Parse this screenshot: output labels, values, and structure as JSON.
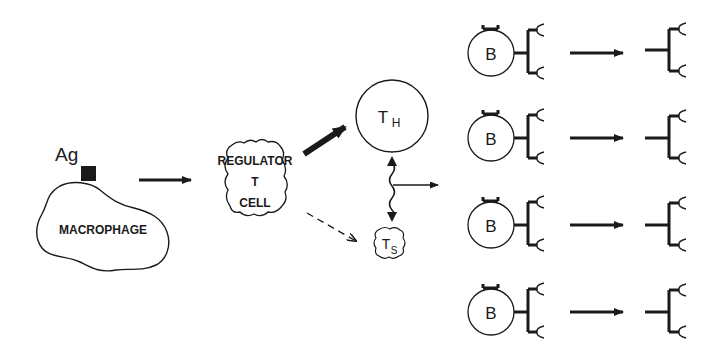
{
  "diagram": {
    "antigen": {
      "label": "Ag"
    },
    "macrophage": {
      "label": "MACROPHAGE"
    },
    "regulator": {
      "line1": "REGULATOR",
      "line2": "T",
      "line3": "CELL"
    },
    "helper": {
      "main": "T",
      "sub": "H"
    },
    "suppressor": {
      "main": "T",
      "sub": "S"
    },
    "b_cells": [
      {
        "label": "B"
      },
      {
        "label": "B"
      },
      {
        "label": "B"
      },
      {
        "label": "B"
      }
    ],
    "colors": {
      "ink": "#1a1a1a",
      "background": "#ffffff"
    }
  }
}
